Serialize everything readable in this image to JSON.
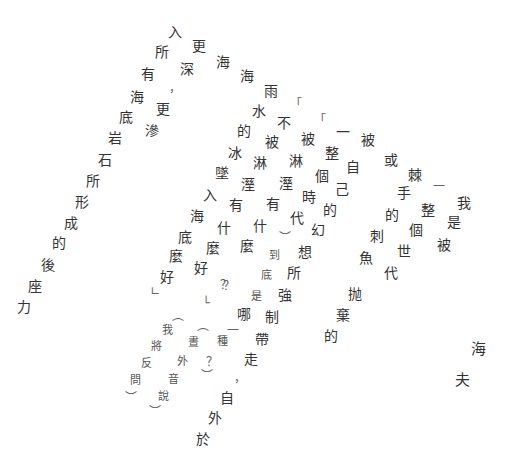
{
  "poem": {
    "glyphs": [
      {
        "t": "入",
        "x": 175,
        "y": 32
      },
      {
        "t": "所",
        "x": 162,
        "y": 52
      },
      {
        "t": "有",
        "x": 148,
        "y": 74
      },
      {
        "t": "海",
        "x": 137,
        "y": 97
      },
      {
        "t": "底",
        "x": 126,
        "y": 117
      },
      {
        "t": "岩",
        "x": 115,
        "y": 138
      },
      {
        "t": "石",
        "x": 105,
        "y": 160
      },
      {
        "t": "所",
        "x": 93,
        "y": 181
      },
      {
        "t": "形",
        "x": 82,
        "y": 202
      },
      {
        "t": "成",
        "x": 71,
        "y": 223
      },
      {
        "t": "的",
        "x": 59,
        "y": 243
      },
      {
        "t": "後",
        "x": 48,
        "y": 265
      },
      {
        "t": "座",
        "x": 35,
        "y": 286
      },
      {
        "t": "力",
        "x": 24,
        "y": 307
      },
      {
        "t": "更",
        "x": 199,
        "y": 46
      },
      {
        "t": "深",
        "x": 187,
        "y": 69
      },
      {
        "t": "，",
        "x": 175,
        "y": 88,
        "c": "punct"
      },
      {
        "t": "更",
        "x": 163,
        "y": 109
      },
      {
        "t": "滲",
        "x": 152,
        "y": 131
      },
      {
        "t": "海",
        "x": 223,
        "y": 62
      },
      {
        "t": "海",
        "x": 247,
        "y": 76
      },
      {
        "t": "雨",
        "x": 271,
        "y": 91
      },
      {
        "t": "水",
        "x": 259,
        "y": 111
      },
      {
        "t": "的",
        "x": 244,
        "y": 131
      },
      {
        "t": "冰",
        "x": 235,
        "y": 153
      },
      {
        "t": "墜",
        "x": 222,
        "y": 173
      },
      {
        "t": "入",
        "x": 210,
        "y": 195
      },
      {
        "t": "海",
        "x": 197,
        "y": 216
      },
      {
        "t": "底",
        "x": 185,
        "y": 237
      },
      {
        "t": "麼",
        "x": 176,
        "y": 256
      },
      {
        "t": "好",
        "x": 167,
        "y": 277
      },
      {
        "t": "∟",
        "x": 155,
        "y": 291,
        "c": "punct"
      },
      {
        "t": "「",
        "x": 296,
        "y": 104,
        "c": "punct"
      },
      {
        "t": "不",
        "x": 284,
        "y": 123
      },
      {
        "t": "被",
        "x": 272,
        "y": 142
      },
      {
        "t": "淋",
        "x": 260,
        "y": 163
      },
      {
        "t": "溼",
        "x": 248,
        "y": 184
      },
      {
        "t": "有",
        "x": 236,
        "y": 205
      },
      {
        "t": "什",
        "x": 224,
        "y": 228
      },
      {
        "t": "麼",
        "x": 213,
        "y": 248
      },
      {
        "t": "好",
        "x": 201,
        "y": 268
      },
      {
        "t": "？",
        "x": 226,
        "y": 285,
        "c": "punct"
      },
      {
        "t": "└",
        "x": 206,
        "y": 303,
        "c": "punct"
      },
      {
        "t": "「",
        "x": 320,
        "y": 120,
        "c": "punct"
      },
      {
        "t": "被",
        "x": 308,
        "y": 139
      },
      {
        "t": "淋",
        "x": 296,
        "y": 161
      },
      {
        "t": "溼",
        "x": 286,
        "y": 183
      },
      {
        "t": "有",
        "x": 273,
        "y": 204
      },
      {
        "t": "什",
        "x": 260,
        "y": 226
      },
      {
        "t": "麼",
        "x": 247,
        "y": 246
      },
      {
        "t": "？",
        "x": 229,
        "y": 286,
        "c": "punct"
      },
      {
        "t": "一",
        "x": 343,
        "y": 132
      },
      {
        "t": "整",
        "x": 332,
        "y": 153
      },
      {
        "t": "個",
        "x": 322,
        "y": 176
      },
      {
        "t": "時",
        "x": 309,
        "y": 197
      },
      {
        "t": "代",
        "x": 297,
        "y": 218
      },
      {
        "t": "︶",
        "x": 285,
        "y": 238,
        "c": "punct"
      },
      {
        "t": "到",
        "x": 274,
        "y": 256,
        "c": "sm"
      },
      {
        "t": "底",
        "x": 266,
        "y": 276,
        "c": "sm"
      },
      {
        "t": "是",
        "x": 256,
        "y": 297,
        "c": "sm"
      },
      {
        "t": "哪",
        "x": 244,
        "y": 314
      },
      {
        "t": "一",
        "x": 233,
        "y": 331,
        "c": "punct"
      },
      {
        "t": "種",
        "x": 222,
        "y": 342,
        "c": "sm"
      },
      {
        "t": "？",
        "x": 212,
        "y": 362,
        "c": "punct"
      },
      {
        "t": "︶",
        "x": 207,
        "y": 376,
        "c": "punct"
      },
      {
        "t": "被",
        "x": 368,
        "y": 140
      },
      {
        "t": "自",
        "x": 353,
        "y": 167
      },
      {
        "t": "己",
        "x": 342,
        "y": 189
      },
      {
        "t": "的",
        "x": 330,
        "y": 210
      },
      {
        "t": "幻",
        "x": 318,
        "y": 230
      },
      {
        "t": "想",
        "x": 305,
        "y": 252
      },
      {
        "t": "所",
        "x": 294,
        "y": 273
      },
      {
        "t": "強",
        "x": 285,
        "y": 295
      },
      {
        "t": "制",
        "x": 272,
        "y": 317
      },
      {
        "t": "帶",
        "x": 262,
        "y": 339
      },
      {
        "t": "走",
        "x": 251,
        "y": 359
      },
      {
        "t": "，",
        "x": 240,
        "y": 378,
        "c": "punct"
      },
      {
        "t": "自",
        "x": 227,
        "y": 398
      },
      {
        "t": "外",
        "x": 215,
        "y": 418
      },
      {
        "t": "於",
        "x": 203,
        "y": 439
      },
      {
        "t": "或",
        "x": 391,
        "y": 160
      },
      {
        "t": "手",
        "x": 404,
        "y": 193
      },
      {
        "t": "的",
        "x": 392,
        "y": 215
      },
      {
        "t": "刺",
        "x": 377,
        "y": 236
      },
      {
        "t": "魚",
        "x": 366,
        "y": 258
      },
      {
        "t": "抛",
        "x": 355,
        "y": 294
      },
      {
        "t": "棄",
        "x": 343,
        "y": 315
      },
      {
        "t": "的",
        "x": 331,
        "y": 336
      },
      {
        "t": "棘",
        "x": 415,
        "y": 175
      },
      {
        "t": "整",
        "x": 428,
        "y": 210
      },
      {
        "t": "個",
        "x": 416,
        "y": 230
      },
      {
        "t": "世",
        "x": 404,
        "y": 251
      },
      {
        "t": "代",
        "x": 391,
        "y": 273
      },
      {
        "t": "一",
        "x": 439,
        "y": 187,
        "c": "punct"
      },
      {
        "t": "被",
        "x": 444,
        "y": 245
      },
      {
        "t": "是",
        "x": 454,
        "y": 222
      },
      {
        "t": "我",
        "x": 464,
        "y": 203
      },
      {
        "t": "海",
        "x": 478,
        "y": 349,
        "c": "lg"
      },
      {
        "t": "夫",
        "x": 462,
        "y": 380,
        "c": "lg"
      },
      {
        "t": "︵",
        "x": 178,
        "y": 316,
        "c": "punct"
      },
      {
        "t": "我",
        "x": 167,
        "y": 331,
        "c": "sm"
      },
      {
        "t": "將",
        "x": 156,
        "y": 347,
        "c": "sm"
      },
      {
        "t": "反",
        "x": 146,
        "y": 364,
        "c": "sm"
      },
      {
        "t": "問",
        "x": 135,
        "y": 381,
        "c": "sm"
      },
      {
        "t": "︶",
        "x": 131,
        "y": 398,
        "c": "punct"
      },
      {
        "t": "︵",
        "x": 203,
        "y": 326,
        "c": "punct"
      },
      {
        "t": "晝",
        "x": 193,
        "y": 343,
        "c": "sm"
      },
      {
        "t": "外",
        "x": 182,
        "y": 362,
        "c": "sm"
      },
      {
        "t": "音",
        "x": 173,
        "y": 380,
        "c": "sm"
      },
      {
        "t": "說",
        "x": 163,
        "y": 397,
        "c": "sm"
      },
      {
        "t": "︶",
        "x": 155,
        "y": 412,
        "c": "punct"
      }
    ]
  }
}
